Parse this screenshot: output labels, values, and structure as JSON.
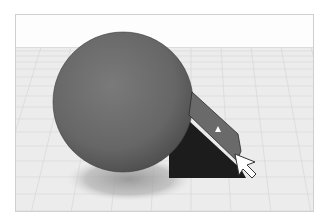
{
  "app": {
    "view": "3D workplane viewport"
  },
  "scene": {
    "colors": {
      "sky": "#fdfdfd",
      "grid_bg": "#ececec",
      "grid_line": "#d6d6d6",
      "grid_major": "#c8c8c8",
      "sphere": "#6e6e6e",
      "sphere_dark": "#4a4a4a",
      "shadow": "#9a9a9a",
      "wedge_face": "#6a6a6a",
      "wedge_side": "#1c1c1c",
      "cursor_fill": "#ffffff",
      "cursor_stroke": "#333333"
    },
    "objects": [
      {
        "name": "sphere",
        "type": "sphere"
      },
      {
        "name": "wedge",
        "type": "wedge",
        "selected": true
      }
    ],
    "cursor": {
      "type": "arrow",
      "x": 234,
      "y": 153
    }
  }
}
